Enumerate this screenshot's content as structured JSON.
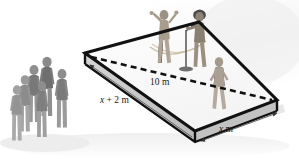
{
  "figure": {
    "kind": "geometry-diagram",
    "background_color": "#ffffff",
    "outline_color": "#111111",
    "surface_color": "#fbfbfb",
    "side_face_color": "#c9c9c9",
    "shadow_color": "#e2e2e2"
  },
  "labels": {
    "diagonal": {
      "full": "10 m",
      "value": "10",
      "unit": "m",
      "describes": "dashed diagonal of the stage"
    },
    "left_edge": {
      "full": "x + 2 m",
      "variable": "x",
      "operator": "+",
      "constant": "2",
      "unit": "m",
      "describes": "left (depth) edge of the stage"
    },
    "bottom_edge": {
      "full": "x m",
      "variable": "x",
      "unit": "m",
      "describes": "bottom right (width) edge of the stage"
    }
  },
  "stage": {
    "name": "stage-platform",
    "corners": {
      "left": [
        85,
        53
      ],
      "top": [
        199,
        22
      ],
      "right": [
        277,
        100
      ],
      "bottom": [
        195,
        131
      ]
    },
    "thickness_px": 11,
    "outline_width_px": 3,
    "diagonal": {
      "from": [
        90,
        57
      ],
      "to": [
        272,
        100
      ],
      "style": "dashed",
      "dash_length_px": 6,
      "gap_px": 4
    }
  },
  "dimension_lines": [
    {
      "name": "left-edge-dimension",
      "label": "x + 2 m",
      "from": [
        88,
        63
      ],
      "to": [
        193,
        139
      ],
      "arrow_at": "start"
    },
    {
      "name": "bottom-edge-dimension",
      "label": "x m",
      "from": [
        200,
        140
      ],
      "to": [
        279,
        112
      ],
      "arrow_at": "both"
    }
  ],
  "performers": [
    {
      "name": "performer-arms-raised",
      "pose": "arms raised",
      "x": 160,
      "y": 12
    },
    {
      "name": "performer-at-microphone",
      "pose": "singing at mic stand",
      "x": 193,
      "y": 10
    },
    {
      "name": "performer-walking",
      "pose": "walking",
      "x": 216,
      "y": 60
    }
  ],
  "stage_props": [
    {
      "name": "microphone-stand",
      "x": 186,
      "y": 30
    },
    {
      "name": "cable",
      "x": 150,
      "y": 45
    }
  ],
  "audience": {
    "name": "audience-group",
    "count": 6,
    "members": [
      {
        "name": "audience-person-1",
        "x": 14,
        "y": 84
      },
      {
        "name": "audience-person-2",
        "x": 25,
        "y": 76
      },
      {
        "name": "audience-person-3",
        "x": 30,
        "y": 66
      },
      {
        "name": "audience-person-4",
        "x": 40,
        "y": 60
      },
      {
        "name": "audience-person-5",
        "x": 38,
        "y": 86
      },
      {
        "name": "audience-person-6",
        "x": 55,
        "y": 82
      }
    ]
  }
}
